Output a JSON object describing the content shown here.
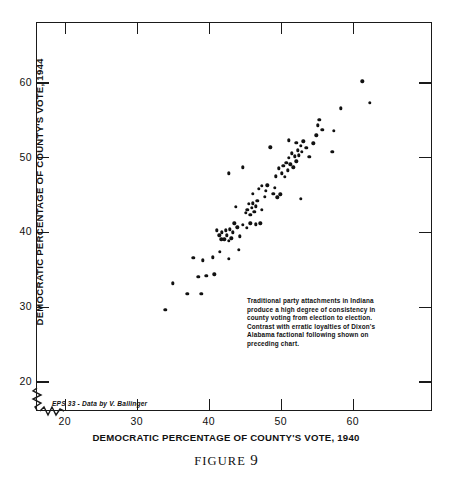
{
  "figure": {
    "caption_word": "FIGURE",
    "caption_number": "9"
  },
  "credit": "EPS 33 - Data by V. Ballinger",
  "annotation": {
    "lines": [
      "Traditional party attachments in Indiana",
      "produce a high degree of consistency in",
      "county voting from election to election.",
      "Contrast with erratic loyalties of Dixon's",
      "Alabama factional following shown on",
      "preceding chart."
    ]
  },
  "chart_data": {
    "type": "scatter",
    "title": "",
    "xlabel": "DEMOCRATIC PERCENTAGE OF COUNTY'S VOTE, 1940",
    "ylabel": "DEMOCRATIC PERCENTAGE OF COUNTY'S VOTE, 1944",
    "xlim": [
      16,
      71
    ],
    "ylim": [
      16,
      68
    ],
    "xticks": [
      20,
      30,
      40,
      50,
      60
    ],
    "yticks": [
      20,
      30,
      40,
      50,
      60
    ],
    "xticklabels": [
      "20",
      "30",
      "40",
      "50",
      "60"
    ],
    "yticklabels": [
      "20",
      "30",
      "40",
      "50",
      "60"
    ],
    "grid": false,
    "legend": null,
    "axis_break": {
      "x": true,
      "y": true
    },
    "marker": {
      "shape": "circle",
      "color": "#111111",
      "size": 3.4
    },
    "points": [
      [
        33.8,
        29.7
      ],
      [
        34.9,
        33.2
      ],
      [
        36.9,
        31.8
      ],
      [
        38.4,
        34.1
      ],
      [
        38.8,
        31.8
      ],
      [
        39.5,
        34.2
      ],
      [
        40.6,
        34.4
      ],
      [
        37.7,
        36.6
      ],
      [
        39.0,
        36.3
      ],
      [
        40.4,
        36.7
      ],
      [
        41.4,
        37.4
      ],
      [
        42.6,
        36.5
      ],
      [
        44.0,
        37.7
      ],
      [
        41.0,
        40.3
      ],
      [
        41.3,
        39.6
      ],
      [
        41.6,
        39.1
      ],
      [
        41.7,
        40.0
      ],
      [
        42.0,
        39.1
      ],
      [
        42.2,
        40.3
      ],
      [
        42.4,
        39.6
      ],
      [
        42.6,
        38.9
      ],
      [
        42.8,
        40.4
      ],
      [
        43.0,
        39.2
      ],
      [
        43.2,
        40.0
      ],
      [
        43.4,
        41.2
      ],
      [
        43.8,
        40.7
      ],
      [
        44.2,
        39.5
      ],
      [
        44.6,
        41.0
      ],
      [
        45.1,
        40.6
      ],
      [
        45.6,
        41.2
      ],
      [
        46.4,
        41.1
      ],
      [
        47.0,
        41.2
      ],
      [
        42.6,
        47.9
      ],
      [
        43.6,
        43.4
      ],
      [
        44.6,
        48.7
      ],
      [
        45.0,
        42.6
      ],
      [
        45.2,
        43.0
      ],
      [
        45.4,
        43.8
      ],
      [
        45.6,
        42.4
      ],
      [
        45.8,
        43.3
      ],
      [
        46.0,
        43.9
      ],
      [
        46.2,
        42.8
      ],
      [
        46.4,
        43.5
      ],
      [
        46.6,
        44.2
      ],
      [
        46.0,
        45.2
      ],
      [
        46.8,
        45.8
      ],
      [
        47.2,
        46.2
      ],
      [
        47.6,
        44.8
      ],
      [
        47.2,
        43.0
      ],
      [
        47.8,
        45.6
      ],
      [
        48.0,
        46.3
      ],
      [
        48.4,
        51.4
      ],
      [
        48.8,
        45.2
      ],
      [
        49.0,
        46.0
      ],
      [
        49.4,
        44.7
      ],
      [
        49.8,
        45.1
      ],
      [
        49.2,
        47.5
      ],
      [
        49.6,
        48.6
      ],
      [
        50.0,
        47.9
      ],
      [
        50.2,
        48.9
      ],
      [
        50.4,
        47.4
      ],
      [
        50.6,
        49.3
      ],
      [
        50.8,
        48.3
      ],
      [
        51.0,
        50.0
      ],
      [
        51.2,
        49.1
      ],
      [
        51.4,
        50.6
      ],
      [
        51.6,
        48.7
      ],
      [
        51.8,
        50.2
      ],
      [
        52.0,
        49.5
      ],
      [
        52.2,
        51.0
      ],
      [
        52.4,
        50.3
      ],
      [
        52.6,
        51.6
      ],
      [
        52.8,
        50.8
      ],
      [
        51.0,
        52.3
      ],
      [
        52.0,
        52.0
      ],
      [
        53.0,
        52.2
      ],
      [
        53.4,
        51.3
      ],
      [
        52.6,
        44.5
      ],
      [
        53.8,
        50.1
      ],
      [
        54.4,
        51.9
      ],
      [
        54.8,
        53.0
      ],
      [
        55.0,
        54.3
      ],
      [
        55.2,
        55.1
      ],
      [
        55.6,
        53.7
      ],
      [
        57.0,
        50.8
      ],
      [
        57.2,
        53.6
      ],
      [
        58.2,
        56.6
      ],
      [
        61.2,
        60.2
      ],
      [
        62.2,
        57.3
      ]
    ]
  }
}
